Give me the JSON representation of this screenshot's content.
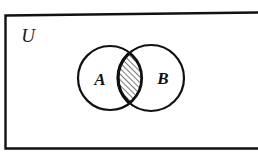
{
  "figure": {
    "kind": "venn-diagram",
    "caption": "",
    "width": 258,
    "height": 156,
    "background_color": "#ffffff",
    "ink_color": "#000000"
  },
  "universe": {
    "label": "U",
    "label_x": 28,
    "label_y": 42,
    "label_size": 19,
    "rect": {
      "left": 5,
      "top": 14,
      "right": 262,
      "bottom": 148,
      "stroke_width": 2.4,
      "right_edge_visible": false,
      "tilt_note": "top edge rises slightly toward the right"
    }
  },
  "sets": [
    {
      "name": "set-a",
      "label": "A",
      "cx": 110,
      "cy": 78,
      "r": 32,
      "label_x": 100,
      "label_y": 85,
      "label_size": 17,
      "stroke_width": 2.2
    },
    {
      "name": "set-b",
      "label": "B",
      "cx": 151,
      "cy": 78,
      "r": 33,
      "label_x": 163,
      "label_y": 84,
      "label_size": 17,
      "stroke_width": 2.2
    }
  ],
  "shaded_region": {
    "name": "a-intersect-b",
    "description": "A intersect B",
    "fill_pattern": "diagonal-hatch",
    "hatch_direction": "lower-left-to-upper-right",
    "hatch_spacing": 4,
    "hatch_stroke_width": 1.1,
    "outline_stroke_width": 3.2,
    "shaded": true
  }
}
